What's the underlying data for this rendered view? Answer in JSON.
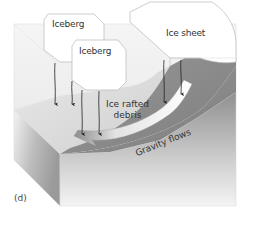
{
  "diagram": {
    "panel_label": "(d)",
    "labels": {
      "iceberg_1": "Iceberg",
      "iceberg_2": "Iceberg",
      "ice_sheet": "Ice sheet",
      "ice_rafted_line1": "Ice rafted",
      "ice_rafted_line2": "debris",
      "gravity_flows": "Gravity flows"
    },
    "colors": {
      "background": "#ffffff",
      "ice": "#ffffff",
      "ice_edge": "#b8b8b8",
      "shelf_light": "#d9d9d9",
      "slope_dark": "#8a8a8a",
      "flow_channel": "#f2f2f2",
      "arrow": "#222222",
      "text": "#333333"
    }
  }
}
